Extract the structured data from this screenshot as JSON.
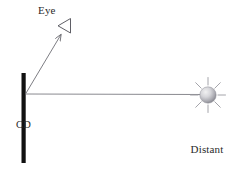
{
  "figure": {
    "type": "optics-ray-diagram",
    "background_color": "#ffffff",
    "width": 239,
    "height": 175
  },
  "labels": {
    "eye": "Eye",
    "cd": "CD",
    "bulb_line1": "Distant",
    "bulb_line2": "light",
    "bulb_line3": "bulb"
  },
  "elements": {
    "cd_bar": {
      "name": "CD",
      "color": "#111111",
      "x": 22,
      "y_top": 73,
      "y_bottom": 163,
      "thickness": 4
    },
    "incident_ray": {
      "name": "incident light ray",
      "color": "#7c7c82",
      "from_x": 205,
      "from_y": 95,
      "to_x": 25,
      "to_y": 94
    },
    "reflected_ray": {
      "name": "reflected ray to eye",
      "color": "#7c7c82",
      "from_x": 25,
      "from_y": 94,
      "to_x": 62,
      "to_y": 33,
      "arrowhead": true
    },
    "eye_symbol": {
      "name": "eye triangle",
      "color": "#5f5f66",
      "apex_x": 58,
      "apex_y": 26,
      "points": "70,19 70,33 58,26"
    },
    "light_bulb": {
      "name": "distant light bulb",
      "center_x": 208,
      "center_y": 95,
      "radius": 8,
      "fill_light": "#e2e2e4",
      "fill_dark": "#8e8e95",
      "ray_color": "#9a9aa0",
      "ray_count": 8
    }
  },
  "colors": {
    "ink": "#2b2b2b",
    "line": "#7c7c82",
    "cd": "#111111",
    "bulb_ray": "#9a9aa0"
  }
}
